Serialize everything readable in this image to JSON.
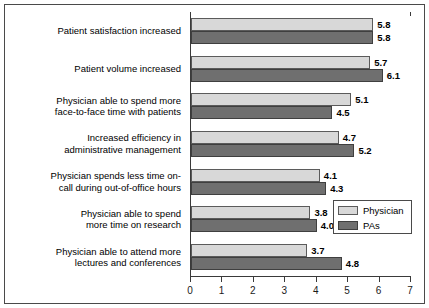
{
  "chart_data": {
    "type": "bar",
    "orientation": "horizontal",
    "title": "",
    "xlabel": "",
    "ylabel": "",
    "xlim": [
      0,
      7
    ],
    "xticks": [
      "0",
      "1",
      "2",
      "3",
      "4",
      "5",
      "6",
      "7"
    ],
    "grid": false,
    "legend_position": "inside-bottom-right",
    "categories": [
      "Patient satisfaction increased",
      "Patient volume increased",
      "Physician able to spend more face-to-face time with patients",
      "Increased efficiency in administrative management",
      "Physician spends less time on-call during out-of-office hours",
      "Physician able to spend more time on research",
      "Physician able to attend more lectures and conferences"
    ],
    "category_lines": [
      [
        "Patient satisfaction increased"
      ],
      [
        "Patient volume increased"
      ],
      [
        "Physician able to spend more",
        "face-to-face time with patients"
      ],
      [
        "Increased efficiency in",
        "administrative management"
      ],
      [
        "Physician spends less time on-",
        "call during out-of-office hours"
      ],
      [
        "Physician able to spend",
        "more time on research"
      ],
      [
        "Physician able to attend more",
        "lectures and conferences"
      ]
    ],
    "series": [
      {
        "name": "Physician",
        "color": "#d8d8d8",
        "values": [
          5.8,
          5.7,
          5.1,
          4.7,
          4.1,
          3.8,
          3.7
        ],
        "labels": [
          "5.8",
          "5.7",
          "5.1",
          "4.7",
          "4.1",
          "3.8",
          "3.7"
        ]
      },
      {
        "name": "PAs",
        "color": "#6f6f6f",
        "values": [
          5.8,
          6.1,
          4.5,
          5.2,
          4.3,
          4.0,
          4.8
        ],
        "labels": [
          "5.8",
          "6.1",
          "4.5",
          "5.2",
          "4.3",
          "4.0",
          "4.8"
        ]
      }
    ]
  },
  "legend": {
    "items": [
      {
        "label": "Physician",
        "color": "#d8d8d8"
      },
      {
        "label": "PAs",
        "color": "#6f6f6f"
      }
    ]
  }
}
